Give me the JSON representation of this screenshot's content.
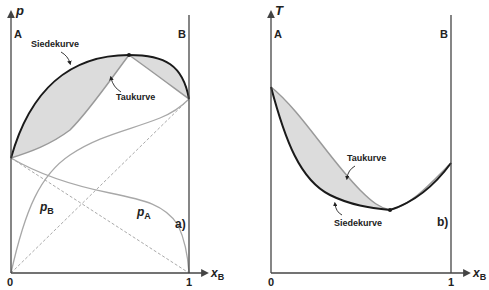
{
  "panels": [
    {
      "id": "a",
      "panel_label": "a)",
      "y_axis_label": "p",
      "x_axis_label": "x",
      "x_axis_sub": "B",
      "x_tick_0": "0",
      "x_tick_1": "1",
      "left_component": "A",
      "right_component": "B",
      "curves": {
        "boiling": "Siedekurve",
        "dew": "Taukurve",
        "partial_A": "p",
        "partial_A_sub": "A",
        "partial_B": "p",
        "partial_B_sub": "B"
      }
    },
    {
      "id": "b",
      "panel_label": "b)",
      "y_axis_label": "T",
      "x_axis_label": "x",
      "x_axis_sub": "B",
      "x_tick_0": "0",
      "x_tick_1": "1",
      "left_component": "A",
      "right_component": "B",
      "curves": {
        "boiling": "Siedekurve",
        "dew": "Taukurve"
      }
    }
  ],
  "colors": {
    "boiling_curve": "#1a1a1a",
    "dew_curve": "#9a9a9a",
    "fill_two_phase": "#dcdcdc",
    "partial_curves": "#a8a8a8",
    "axis": "#444444"
  }
}
